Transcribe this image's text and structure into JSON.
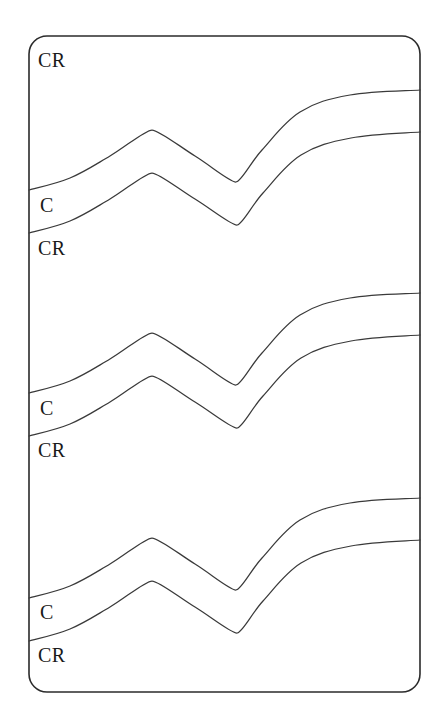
{
  "figure": {
    "background_color": "#ffffff",
    "line_color": "#3a3a3a",
    "frame_color": "#2b2b2b",
    "label_color": "#1a1a1a",
    "frame": {
      "x": 29,
      "y": 36,
      "width": 391,
      "height": 656,
      "corner_radius": 18
    }
  },
  "labels": [
    {
      "text": "CR",
      "x": 38,
      "y": 50,
      "group": 1,
      "role": "upper-band-label"
    },
    {
      "text": "C",
      "x": 40,
      "y": 195,
      "group": 1,
      "role": "middle-band-label"
    },
    {
      "text": "CR",
      "x": 38,
      "y": 238,
      "group": 1,
      "role": "lower-band-label"
    },
    {
      "text": "C",
      "x": 40,
      "y": 398,
      "group": 2,
      "role": "middle-band-label"
    },
    {
      "text": "CR",
      "x": 38,
      "y": 440,
      "group": 2,
      "role": "lower-band-label"
    },
    {
      "text": "C",
      "x": 40,
      "y": 602,
      "group": 3,
      "role": "middle-band-label"
    },
    {
      "text": "CR",
      "x": 38,
      "y": 645,
      "group": 3,
      "role": "lower-band-label"
    }
  ],
  "chart_data": {
    "type": "line",
    "title": "",
    "subtitle": "",
    "xlabel": "",
    "ylabel": "",
    "xlim": [
      29,
      420
    ],
    "ylim": [
      36,
      692
    ],
    "grid": false,
    "legend": null,
    "y_axis_inverted": true,
    "annotations": [
      "CR",
      "C",
      "CR",
      "C",
      "CR",
      "C",
      "CR"
    ],
    "series": [
      {
        "name": "group-1-upper",
        "group": 1,
        "x": [
          29,
          70,
          110,
          152,
          195,
          236,
          262,
          300,
          350,
          420
        ],
        "y": [
          190,
          178,
          156,
          130,
          156,
          182,
          150,
          112,
          95,
          90
        ]
      },
      {
        "name": "group-1-lower",
        "group": 1,
        "x": [
          29,
          70,
          110,
          152,
          195,
          237,
          263,
          301,
          351,
          420
        ],
        "y": [
          233,
          221,
          199,
          173,
          199,
          225,
          193,
          155,
          138,
          132
        ]
      },
      {
        "name": "group-2-upper",
        "group": 2,
        "x": [
          29,
          70,
          110,
          152,
          195,
          236,
          262,
          300,
          350,
          420
        ],
        "y": [
          393,
          381,
          359,
          333,
          359,
          385,
          353,
          315,
          298,
          293
        ]
      },
      {
        "name": "group-2-lower",
        "group": 2,
        "x": [
          29,
          70,
          110,
          152,
          195,
          237,
          263,
          301,
          351,
          420
        ],
        "y": [
          436,
          424,
          402,
          376,
          402,
          428,
          396,
          358,
          341,
          335
        ]
      },
      {
        "name": "group-3-upper",
        "group": 3,
        "x": [
          29,
          70,
          110,
          152,
          195,
          236,
          262,
          300,
          350,
          420
        ],
        "y": [
          598,
          586,
          564,
          538,
          564,
          590,
          558,
          520,
          503,
          498
        ]
      },
      {
        "name": "group-3-lower",
        "group": 3,
        "x": [
          29,
          70,
          110,
          152,
          195,
          237,
          263,
          301,
          351,
          420
        ],
        "y": [
          641,
          629,
          607,
          581,
          607,
          633,
          601,
          563,
          546,
          540
        ]
      }
    ]
  }
}
